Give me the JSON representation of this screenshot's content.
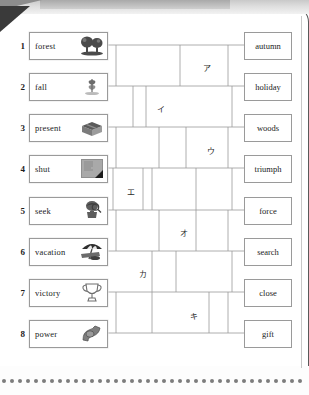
{
  "page": {
    "type": "matching-maze-worksheet",
    "bottom_rule": "dotted"
  },
  "left_column": {
    "items": [
      {
        "number": "1",
        "word": "forest",
        "icon": "trees-icon"
      },
      {
        "number": "2",
        "word": "fall",
        "icon": "falling-leaf-icon"
      },
      {
        "number": "3",
        "word": "present",
        "icon": "gift-box-icon"
      },
      {
        "number": "4",
        "word": "shut",
        "icon": "closed-book-icon"
      },
      {
        "number": "5",
        "word": "seek",
        "icon": "searching-person-icon"
      },
      {
        "number": "6",
        "word": "vacation",
        "icon": "beach-umbrella-icon"
      },
      {
        "number": "7",
        "word": "victory",
        "icon": "trophy-icon"
      },
      {
        "number": "8",
        "word": "power",
        "icon": "flexed-arm-icon"
      }
    ]
  },
  "right_column": {
    "items": [
      {
        "word": "autumn"
      },
      {
        "word": "holiday"
      },
      {
        "word": "woods"
      },
      {
        "word": "triumph"
      },
      {
        "word": "force"
      },
      {
        "word": "search"
      },
      {
        "word": "close"
      },
      {
        "word": "gift"
      }
    ]
  },
  "maze_labels": [
    {
      "label": "ア",
      "x": 203,
      "y": 62
    },
    {
      "label": "イ",
      "x": 157,
      "y": 103
    },
    {
      "label": "ウ",
      "x": 207,
      "y": 145
    },
    {
      "label": "エ",
      "x": 127,
      "y": 186
    },
    {
      "label": "オ",
      "x": 180,
      "y": 227
    },
    {
      "label": "カ",
      "x": 139,
      "y": 268
    },
    {
      "label": "キ",
      "x": 190,
      "y": 310
    }
  ],
  "colors": {
    "line": "#9a9a9a",
    "text": "#1b1b1b",
    "border": "#5a5a5a",
    "dot": "#7d7d7d"
  }
}
